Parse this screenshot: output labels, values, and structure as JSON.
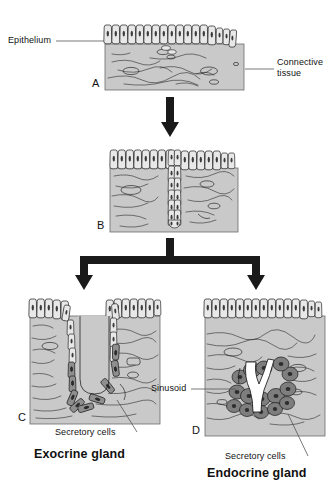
{
  "figure": {
    "title_implicit": "Development of exocrine and endocrine glands from epithelium",
    "background": "#ffffff",
    "colors": {
      "tissue_fill": "#c9c9c9",
      "cell_fill": "#e8e8e8",
      "secretory_fill": "#8f8f8f",
      "secretory_fill_dark": "#6f6f6f",
      "nucleus": "#3a3a3a",
      "outline": "#1a1a1a",
      "arrow": "#1a1a1a",
      "leader": "#555555",
      "sinusoid_fill": "#ffffff"
    }
  },
  "labels": {
    "epithelium": "Epithelium",
    "connective_tissue": "Connective\ntissue",
    "sinusoid": "Sinusoid",
    "secretory_cells_left": "Secretory cells",
    "secretory_cells_right": "Secretory cells",
    "exocrine_gland": "Exocrine gland",
    "endocrine_gland": "Endocrine gland"
  },
  "panels": [
    {
      "letter": "A",
      "name": "simple-epithelium-on-connective-tissue",
      "description": "Simple columnar epithelium resting on connective tissue",
      "epithelial_cells": 17,
      "box": {
        "x": 105,
        "y": 44,
        "w": 139,
        "h": 46
      }
    },
    {
      "letter": "B",
      "name": "epithelial-downgrowth",
      "description": "Epithelial cells grow downward into connective tissue forming a cord",
      "epithelial_cells": 17,
      "cord_rows": 8,
      "cord_columns": 2,
      "box": {
        "x": 110,
        "y": 168,
        "w": 128,
        "h": 64
      }
    },
    {
      "letter": "C",
      "name": "exocrine-gland",
      "description": "Duct remains connected to surface; secretory cells at base",
      "caption": "Exocrine gland",
      "box": {
        "x": 30,
        "y": 316,
        "w": 130,
        "h": 108
      }
    },
    {
      "letter": "D",
      "name": "endocrine-gland",
      "description": "Connection to surface lost; secretory cell clusters surround a sinusoid",
      "caption": "Endocrine gland",
      "box": {
        "x": 205,
        "y": 316,
        "w": 120,
        "h": 120
      }
    }
  ],
  "arrows": [
    {
      "name": "arrow-a-to-b",
      "from": "A",
      "to": "B",
      "type": "straight-down"
    },
    {
      "name": "arrow-b-to-cd",
      "from": "B",
      "to": [
        "C",
        "D"
      ],
      "type": "forked-down"
    }
  ]
}
